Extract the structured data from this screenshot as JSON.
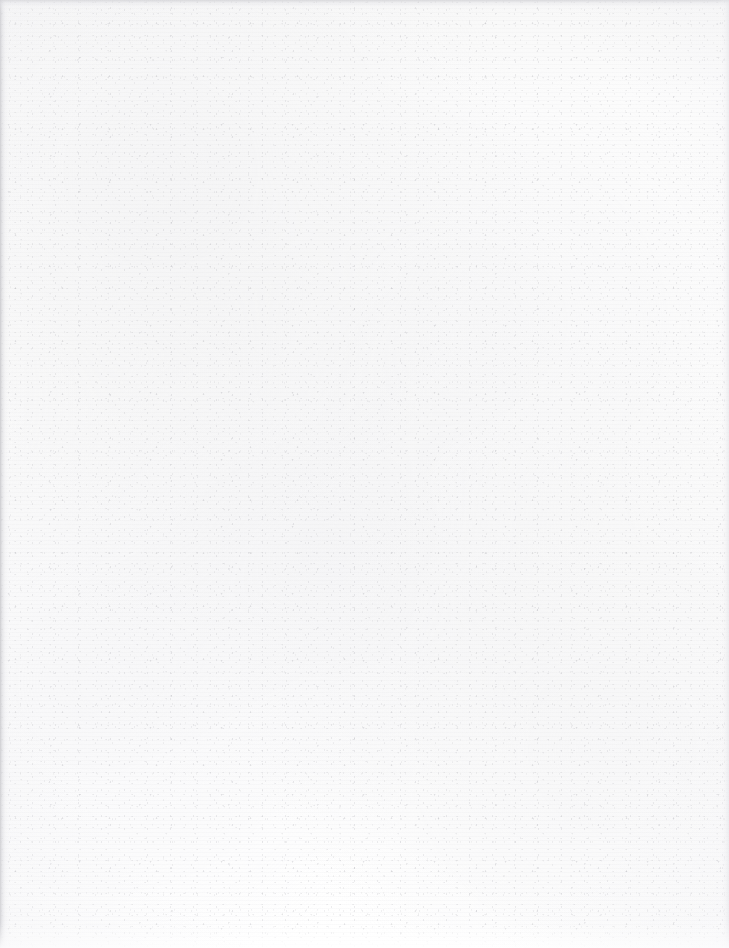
{
  "document": {
    "kind": "scanned-page",
    "page_content_text": "",
    "has_printed_content": false,
    "orientation": "portrait"
  },
  "page": {
    "width_px": 729,
    "height_px": 948
  },
  "appearance": {
    "paper_base_color": "#fbfbfb",
    "paper_highlight_color": "#fefefe",
    "paper_shadow_color": "#f6f6f6",
    "grain_speck_color": "#b4b4ba",
    "dark_speck_color": "#8a8a92",
    "left_gutter_shadow_color": "#c4c4c8",
    "top_edge_shade_color": "#ceced2",
    "right_edge_shade_color": "#e2e2e6",
    "bottom_fade_color": "#ffffff"
  }
}
